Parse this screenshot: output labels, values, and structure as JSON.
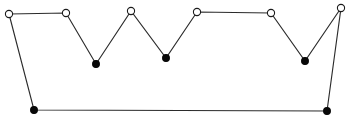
{
  "figure": {
    "title": "Crown-shaped polygon with marked vertices",
    "width": 348,
    "height": 123,
    "background_color": "#ffffff",
    "edge_color": "#2b2b2b",
    "edge_width": 1.15,
    "open_vertex_fill": "#ffffff",
    "open_vertex_stroke": "#1a1a1a",
    "filled_vertex_fill": "#080808",
    "vertex_radius_open": 3.6,
    "vertex_radius_filled": 3.4
  },
  "chart_data": {
    "type": "scatter",
    "title": "Crown-shaped polygon with marked vertices",
    "xlabel": "",
    "ylabel": "",
    "xlim": [
      0,
      348
    ],
    "ylim": [
      0,
      123
    ],
    "grid": false,
    "legend": "none",
    "closed_path": true,
    "vertex_count": 11,
    "marker_legend": [
      {
        "name": "open-circle",
        "meaning": "peak vertex",
        "fill": "#ffffff",
        "stroke": "#1a1a1a"
      },
      {
        "name": "filled-circle",
        "meaning": "valley or base vertex",
        "fill": "#080808",
        "stroke": "#080808"
      }
    ],
    "vertices": [
      {
        "id": "v1",
        "label": "upper-left-peak",
        "x": 9,
        "y": 14,
        "marker": "open"
      },
      {
        "id": "v2",
        "label": "peak-2",
        "x": 66,
        "y": 13,
        "marker": "open"
      },
      {
        "id": "v3",
        "label": "valley-1",
        "x": 96,
        "y": 64,
        "marker": "filled"
      },
      {
        "id": "v4",
        "label": "peak-3",
        "x": 131,
        "y": 11,
        "marker": "open"
      },
      {
        "id": "v5",
        "label": "valley-2",
        "x": 166,
        "y": 58,
        "marker": "filled"
      },
      {
        "id": "v6",
        "label": "peak-4",
        "x": 197,
        "y": 12,
        "marker": "open"
      },
      {
        "id": "v7",
        "label": "peak-5",
        "x": 271,
        "y": 13,
        "marker": "open"
      },
      {
        "id": "v8",
        "label": "valley-3",
        "x": 305,
        "y": 61,
        "marker": "filled"
      },
      {
        "id": "v9",
        "label": "upper-right-peak",
        "x": 341,
        "y": 8,
        "marker": "open"
      },
      {
        "id": "v10",
        "label": "base-right",
        "x": 327,
        "y": 111,
        "marker": "filled"
      },
      {
        "id": "v11",
        "label": "base-left",
        "x": 34,
        "y": 110,
        "marker": "filled"
      }
    ],
    "x": [
      9,
      66,
      96,
      131,
      166,
      197,
      271,
      305,
      341,
      327,
      34
    ],
    "values": [
      14,
      13,
      64,
      11,
      58,
      12,
      13,
      61,
      8,
      111,
      110
    ]
  }
}
